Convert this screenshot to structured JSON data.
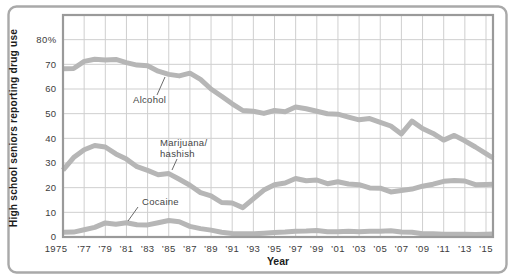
{
  "figure": {
    "border_color": "#a9a9a9",
    "background": "#ffffff"
  },
  "chart_data": {
    "type": "line",
    "title": "",
    "xlabel": "Year",
    "ylabel": "High school seniors reporting drug use",
    "x": [
      1975,
      1976,
      1977,
      1978,
      1979,
      1980,
      1981,
      1982,
      1983,
      1984,
      1985,
      1986,
      1987,
      1988,
      1989,
      1990,
      1991,
      1992,
      1993,
      1994,
      1995,
      1996,
      1997,
      1998,
      1999,
      2000,
      2001,
      2002,
      2003,
      2004,
      2005,
      2006,
      2007,
      2008,
      2009,
      2010,
      2011,
      2012,
      2013,
      2014,
      2015
    ],
    "series": [
      {
        "name": "Alcohol",
        "values": [
          68.2,
          68.3,
          71.2,
          72.1,
          71.8,
          72.0,
          70.7,
          69.7,
          69.4,
          67.2,
          65.9,
          65.3,
          66.4,
          63.9,
          60.0,
          57.1,
          54.0,
          51.3,
          51.0,
          50.1,
          51.3,
          50.8,
          52.7,
          52.0,
          51.0,
          50.0,
          49.8,
          48.6,
          47.5,
          48.0,
          46.5,
          45.0,
          41.8,
          47.0,
          44.0,
          42.0,
          39.3,
          41.2,
          39.0,
          36.5,
          33.8
        ]
      },
      {
        "name": "Marijuana/hashish",
        "values": [
          27.1,
          32.2,
          35.4,
          37.1,
          36.5,
          33.7,
          31.6,
          28.5,
          27.0,
          25.2,
          25.7,
          23.4,
          21.0,
          18.0,
          16.7,
          14.0,
          13.8,
          11.9,
          15.5,
          19.0,
          21.2,
          21.9,
          23.7,
          22.8,
          23.1,
          21.6,
          22.4,
          21.5,
          21.2,
          19.9,
          19.8,
          18.3,
          18.8,
          19.4,
          20.6,
          21.4,
          22.6,
          22.9,
          22.7,
          21.2,
          21.3
        ]
      },
      {
        "name": "Cocaine",
        "values": [
          1.9,
          2.0,
          2.9,
          3.9,
          5.7,
          5.2,
          5.8,
          5.0,
          4.9,
          5.8,
          6.7,
          6.2,
          4.3,
          3.4,
          2.8,
          1.9,
          1.4,
          1.3,
          1.3,
          1.5,
          1.8,
          2.0,
          2.3,
          2.4,
          2.6,
          2.1,
          2.1,
          2.3,
          2.1,
          2.3,
          2.3,
          2.5,
          2.0,
          1.9,
          1.3,
          1.3,
          1.1,
          1.1,
          1.1,
          1.0,
          1.1
        ]
      }
    ],
    "xlim": [
      1975,
      2015.66
    ],
    "ylim": [
      0,
      90
    ],
    "grid": true,
    "x_ticks": [
      {
        "label": "1975",
        "year": 1975,
        "dx": -7
      },
      {
        "label": "’77",
        "year": 1977
      },
      {
        "label": "’79",
        "year": 1979
      },
      {
        "label": "’81",
        "year": 1981
      },
      {
        "label": "’83",
        "year": 1983
      },
      {
        "label": "’85",
        "year": 1985
      },
      {
        "label": "’87",
        "year": 1987
      },
      {
        "label": "’89",
        "year": 1989
      },
      {
        "label": "’91",
        "year": 1991
      },
      {
        "label": "’93",
        "year": 1993
      },
      {
        "label": "’95",
        "year": 1995
      },
      {
        "label": "’97",
        "year": 1997
      },
      {
        "label": "’99",
        "year": 1999
      },
      {
        "label": "’01",
        "year": 2001
      },
      {
        "label": "’03",
        "year": 2003
      },
      {
        "label": "’05",
        "year": 2005
      },
      {
        "label": "’07",
        "year": 2007
      },
      {
        "label": "’09",
        "year": 2009
      },
      {
        "label": "’11",
        "year": 2011
      },
      {
        "label": "’13",
        "year": 2013
      },
      {
        "label": "’15",
        "year": 2015
      }
    ],
    "y_ticks": [
      {
        "label": "0",
        "value": 0
      },
      {
        "label": "10",
        "value": 10
      },
      {
        "label": "20",
        "value": 20
      },
      {
        "label": "30",
        "value": 30
      },
      {
        "label": "40",
        "value": 40
      },
      {
        "label": "50",
        "value": 50
      },
      {
        "label": "60",
        "value": 60
      },
      {
        "label": "70",
        "value": 70
      },
      {
        "label": "80%",
        "value": 80
      }
    ],
    "annotations": [
      {
        "name": "alcohol-label",
        "lines": [
          "Alcohol"
        ],
        "x": 133,
        "y": 103,
        "leader": [
          157,
          95,
          165,
          77
        ]
      },
      {
        "name": "marijuana-label",
        "lines": [
          "Marijuana/",
          "hashish"
        ],
        "x": 160,
        "y": 146,
        "leader": [
          177,
          159,
          172,
          170
        ]
      },
      {
        "name": "cocaine-label",
        "lines": [
          "Cocaine"
        ],
        "x": 142,
        "y": 205,
        "leader": [
          138,
          207,
          128,
          221
        ]
      }
    ],
    "style": {
      "line_color": "#b6b6b6",
      "grid_color": "#cfcfcf",
      "plot_border_color": "#9a9a9a",
      "tick_text_color": "#3c3c3c",
      "axis_title_color": "#1c1c1c",
      "annotation_text_color": "#454545",
      "leader_color": "#5a5a5a"
    }
  }
}
